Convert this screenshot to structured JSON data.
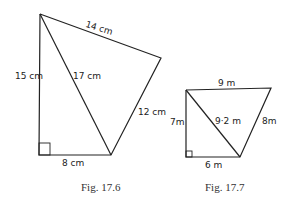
{
  "figures": [
    {
      "caption": "Fig. 17.6",
      "labels": {
        "left": "15 cm",
        "top": "14 cm",
        "diagonal": "17 cm",
        "right": "12 cm",
        "bottom": "8 cm"
      }
    },
    {
      "caption": "Fig. 17.7",
      "labels": {
        "left": "7m",
        "top": "9 m",
        "diagonal": "9·2 m",
        "right": "8m",
        "bottom": "6 m"
      }
    }
  ]
}
